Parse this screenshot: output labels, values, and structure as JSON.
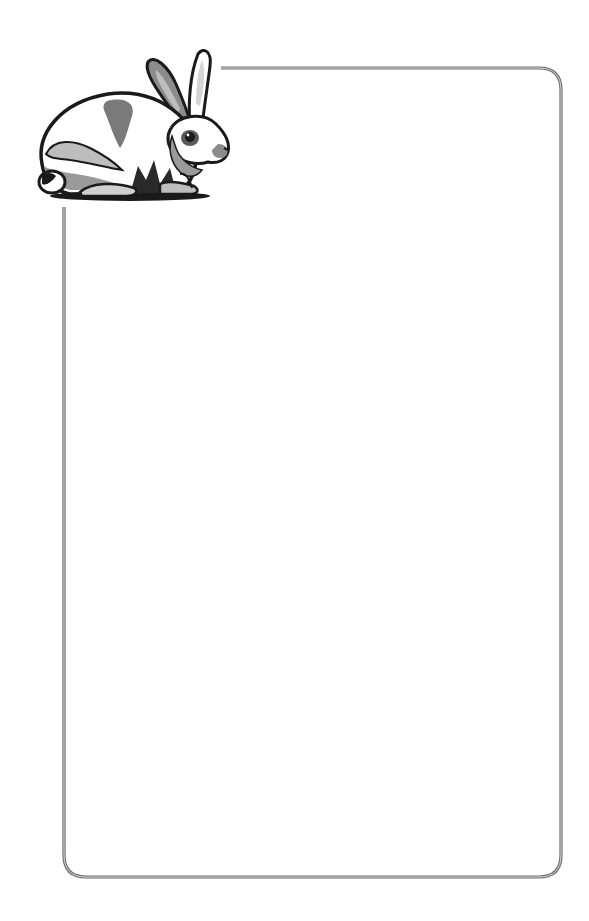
{
  "page": {
    "type": "decorative stationery border",
    "background_color": "#ffffff"
  },
  "frame": {
    "line_color": "#6e6e6e",
    "inner_line_color": "#d8d8d8",
    "corner_radius": 22,
    "top_line_start_x": 221,
    "top_y": 68,
    "left_x": 64,
    "left_line_start_y": 207,
    "right_x": 561,
    "bottom_y": 877
  },
  "illustration": {
    "subject": "rabbit-illustration",
    "style": "grayscale woodcut clip art",
    "colors": {
      "outline": "#1a1a1a",
      "shade_dark": "#5a5a5a",
      "shade_mid": "#8c8c8c",
      "shade_light": "#bdbdbd",
      "fur": "#ffffff"
    }
  },
  "content": {
    "text": ""
  }
}
